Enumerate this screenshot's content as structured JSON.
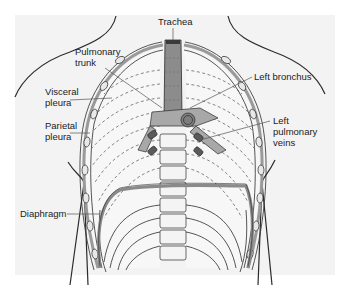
{
  "figure": {
    "background": "#f3f3f3",
    "colors": {
      "outline": "#2b2b2b",
      "pleura_gray": "#9a9a9a",
      "trachea_fill": "#8c8c8c",
      "vessel_fill": "#a8a8a8",
      "leader_line": "#555555"
    }
  },
  "labels": {
    "trachea": "Trachea",
    "pulmonary_trunk": "Pulmonary\ntrunk",
    "visceral_pleura": "Visceral\npleura",
    "parietal_pleura": "Parietal\npleura",
    "left_bronchus": "Left bronchus",
    "left_pulmonary_veins": "Left\npulmonary\nveins",
    "diaphragm": "Diaphragm"
  }
}
